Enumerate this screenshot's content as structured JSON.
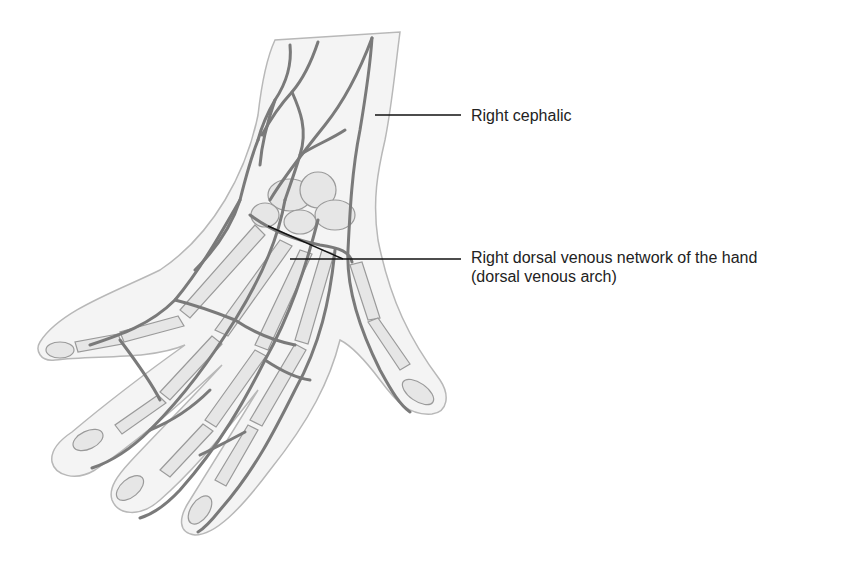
{
  "figure": {
    "colors": {
      "background": "#ffffff",
      "skin_fill": "#f4f4f4",
      "skin_outline": "#b8b8b8",
      "bone_fill": "#e6e6e6",
      "bone_outline": "#9a9a9a",
      "vein": "#7a7a7a",
      "leader_line": "#111111",
      "label_text": "#222222"
    }
  },
  "labels": [
    {
      "id": "cephalic",
      "text": "Right cephalic"
    },
    {
      "id": "dorsal_network",
      "line1": "Right dorsal venous network of the hand",
      "line2": "(dorsal venous arch)"
    }
  ]
}
